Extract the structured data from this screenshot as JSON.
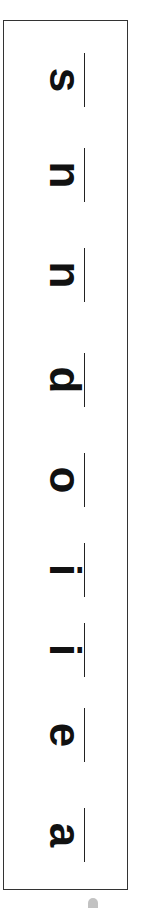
{
  "strip": {
    "orientation": "rotated-90-clockwise",
    "letters_bottom_to_top": [
      "a",
      "e",
      "i",
      "i",
      "o",
      "d",
      "n",
      "n",
      "s"
    ],
    "letters": [
      {
        "char": "s",
        "y": 45
      },
      {
        "char": "n",
        "y": 140
      },
      {
        "char": "n",
        "y": 240
      },
      {
        "char": "d",
        "y": 345
      },
      {
        "char": "o",
        "y": 445
      },
      {
        "char": "i",
        "y": 535
      },
      {
        "char": "i",
        "y": 615
      },
      {
        "char": "e",
        "y": 700
      },
      {
        "char": "a",
        "y": 800
      }
    ]
  },
  "colors": {
    "ink": "#111111",
    "frame": "#333333",
    "background": "#ffffff"
  }
}
